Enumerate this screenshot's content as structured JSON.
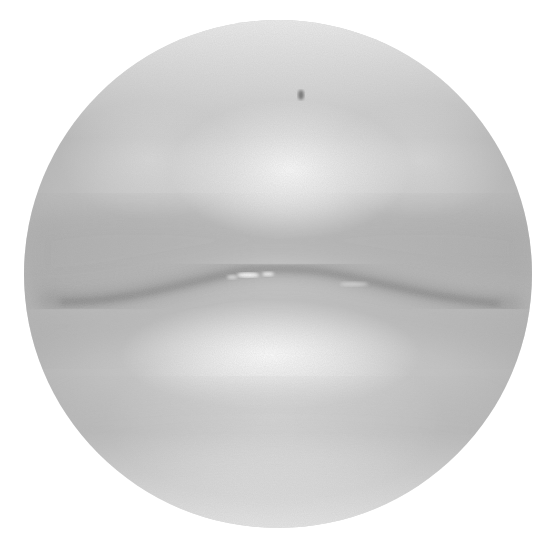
{
  "artwork": {
    "subject": "pencil drawing of closed lips",
    "shape": "circle",
    "canvas": {
      "width": 550,
      "height": 554,
      "background": "#ffffff"
    },
    "circle": {
      "cx": 278,
      "cy": 274,
      "r": 254
    },
    "tones": {
      "base": "#c4c4c4",
      "light": "#f2f2f2",
      "mid": "#a8a8a8",
      "dark": "#7a7a7a",
      "lip_line": "#5e5e5e",
      "highlight": "#ffffff"
    }
  }
}
